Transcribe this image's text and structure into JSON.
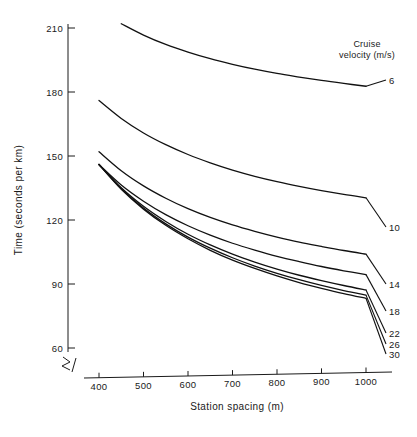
{
  "chart_data": {
    "type": "line",
    "title": "",
    "xlabel": "Station spacing (m)",
    "ylabel": "Time (seconds per km)",
    "xlim": [
      330,
      1040
    ],
    "ylim": [
      55,
      214
    ],
    "xticks": [
      400,
      500,
      600,
      700,
      800,
      900,
      1000
    ],
    "xtick_labels": [
      "400",
      "500",
      "600",
      "700",
      "800",
      "900",
      "1000"
    ],
    "yticks": [
      60,
      90,
      120,
      150,
      180,
      210
    ],
    "ytick_labels": [
      "60",
      "90",
      "120",
      "150",
      "180",
      "210"
    ],
    "grid": false,
    "axis_break": true,
    "legend_position": "right-of-curve-ends",
    "legend_title_line1": "Cruise",
    "legend_title_line2": "velocity (m/s)",
    "x": [
      400,
      450,
      500,
      550,
      600,
      650,
      700,
      750,
      800,
      850,
      900,
      950,
      1000
    ],
    "series": [
      {
        "name": "6",
        "label": "6",
        "values": [
          null,
          212.0,
          206.7,
          202.3,
          198.7,
          195.6,
          193.0,
          190.7,
          188.7,
          187.0,
          185.4,
          184.0,
          182.7
        ]
      },
      {
        "name": "10",
        "label": "10",
        "values": [
          176.0,
          167.6,
          160.8,
          155.3,
          150.7,
          146.8,
          143.4,
          140.5,
          138.0,
          135.8,
          133.8,
          132.0,
          130.4
        ]
      },
      {
        "name": "14",
        "label": "14",
        "values": [
          152.0,
          143.1,
          136.0,
          130.2,
          125.3,
          121.2,
          117.7,
          114.7,
          112.0,
          109.6,
          107.6,
          105.7,
          104.0
        ]
      },
      {
        "name": "18",
        "label": "18",
        "values": [
          146.0,
          136.4,
          128.8,
          122.5,
          117.3,
          112.9,
          109.1,
          105.9,
          103.0,
          100.5,
          98.2,
          96.2,
          94.4
        ]
      },
      {
        "name": "22",
        "label": "22",
        "values": [
          146.0,
          135.1,
          126.4,
          119.3,
          113.3,
          108.3,
          104.0,
          100.3,
          97.0,
          94.1,
          91.6,
          89.3,
          87.2
        ]
      },
      {
        "name": "26",
        "label": "26",
        "values": [
          146.0,
          134.7,
          125.6,
          118.2,
          112.0,
          106.8,
          102.3,
          98.4,
          95.0,
          92.0,
          89.3,
          86.9,
          84.8
        ]
      },
      {
        "name": "30",
        "label": "30",
        "values": [
          146.0,
          134.4,
          125.1,
          117.5,
          111.2,
          105.8,
          101.2,
          97.3,
          93.8,
          90.7,
          88.0,
          85.5,
          83.3
        ]
      }
    ]
  },
  "colors": {
    "ink": "#1a1a1a",
    "curve": "#111111",
    "background": "#ffffff"
  }
}
